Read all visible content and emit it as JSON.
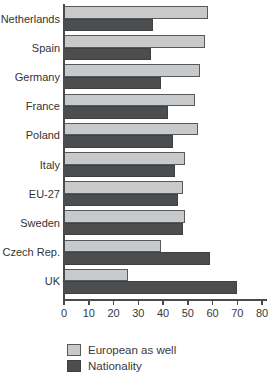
{
  "chart_data": {
    "type": "bar",
    "orientation": "horizontal",
    "title": "",
    "categories": [
      "Netherlands",
      "Spain",
      "Germany",
      "France",
      "Poland",
      "Italy",
      "EU-27",
      "Sweden",
      "Czech Rep.",
      "UK"
    ],
    "series": [
      {
        "name": "European as well",
        "color": "#c8c9cb",
        "border_color": "#58595b",
        "values": [
          58,
          57,
          55,
          53,
          54,
          49,
          48,
          49,
          39,
          26
        ]
      },
      {
        "name": "Nationality",
        "color": "#4c4d4f",
        "border_color": "#3f4042",
        "values": [
          36,
          35,
          39,
          42,
          44,
          45,
          46,
          48,
          59,
          70
        ]
      }
    ],
    "xlim": [
      0,
      80
    ],
    "x_ticks": [
      "0",
      "10",
      "20",
      "30",
      "40",
      "50",
      "60",
      "70",
      "80"
    ],
    "grid": false,
    "legend_position": "bottom-left",
    "axis_color": "#4a4b4d",
    "text_color": "#333335"
  }
}
